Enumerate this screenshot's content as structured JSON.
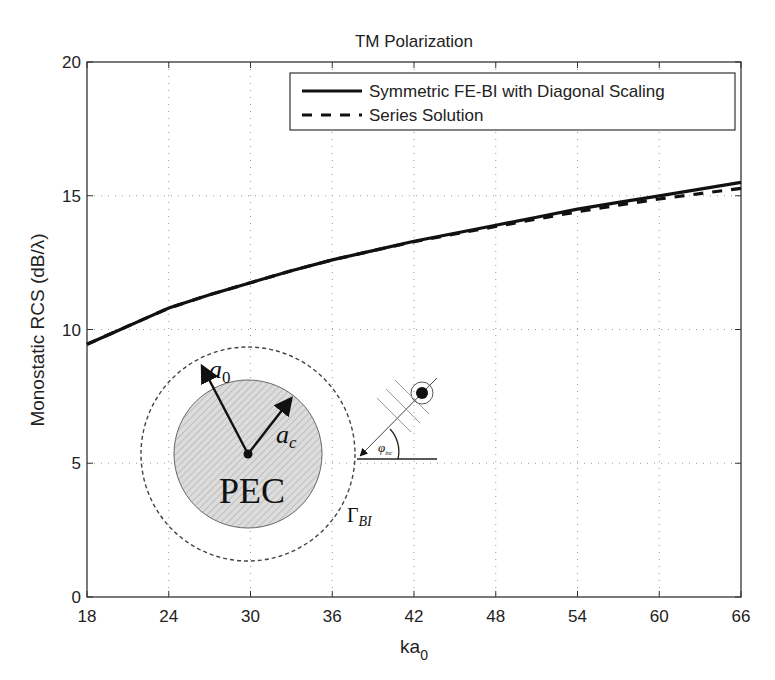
{
  "chart_data": {
    "type": "line",
    "title": "TM Polarization",
    "xlabel": "ka_0",
    "xlabel_main": "ka",
    "xlabel_sub": "0",
    "ylabel": "Monostatic RCS (dB/λ)",
    "xlim": [
      18,
      66
    ],
    "ylim": [
      0,
      20
    ],
    "xticks": [
      18,
      24,
      30,
      36,
      42,
      48,
      54,
      60,
      66
    ],
    "yticks": [
      0,
      5,
      10,
      15,
      20
    ],
    "grid": true,
    "legend_position": "upper right",
    "x": [
      18,
      20,
      22,
      24,
      27,
      30,
      33,
      36,
      39,
      42,
      45,
      48,
      51,
      54,
      57,
      60,
      63,
      66
    ],
    "series": [
      {
        "name": "Symmetric FE-BI with Diagonal Scaling",
        "style": "solid",
        "values": [
          9.45,
          9.9,
          10.35,
          10.8,
          11.3,
          11.75,
          12.2,
          12.6,
          12.95,
          13.3,
          13.6,
          13.9,
          14.2,
          14.5,
          14.75,
          15.0,
          15.25,
          15.5
        ]
      },
      {
        "name": "Series Solution",
        "style": "dashed",
        "values": [
          9.45,
          9.9,
          10.35,
          10.8,
          11.3,
          11.75,
          12.2,
          12.6,
          12.95,
          13.28,
          13.57,
          13.85,
          14.13,
          14.4,
          14.65,
          14.88,
          15.08,
          15.28
        ]
      }
    ],
    "annotations": {
      "inset_labels": {
        "pec": "PEC",
        "a0": "a",
        "a0_sub": "0",
        "ac": "a",
        "ac_sub": "c",
        "gamma": "Γ",
        "gamma_sub": "BI",
        "phi": "φ",
        "phi_sub": "inc"
      }
    }
  },
  "colors": {
    "line": "#111111",
    "grid": "#9a9a9a",
    "axis": "#333333",
    "pec_fill": "#d9d9d9"
  }
}
